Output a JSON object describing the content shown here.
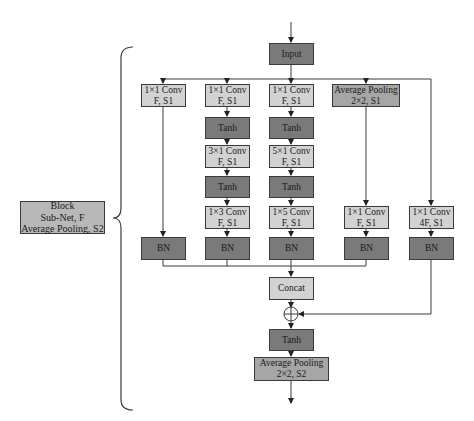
{
  "diagram": {
    "input": {
      "label": "Input"
    },
    "branches": [
      {
        "id": "branch-1",
        "nodes": [
          {
            "label1": "1×1 Conv",
            "label2": "F, S1"
          },
          {
            "label1": "BN"
          }
        ]
      },
      {
        "id": "branch-2",
        "nodes": [
          {
            "label1": "1×1 Conv",
            "label2": "F, S1"
          },
          {
            "label1": "Tanh"
          },
          {
            "label1": "3×1 Conv",
            "label2": "F, S1"
          },
          {
            "label1": "Tanh"
          },
          {
            "label1": "1×3 Conv",
            "label2": "F, S1"
          },
          {
            "label1": "BN"
          }
        ]
      },
      {
        "id": "branch-3",
        "nodes": [
          {
            "label1": "1×1 Conv",
            "label2": "F, S1"
          },
          {
            "label1": "Tanh"
          },
          {
            "label1": "5×1 Conv",
            "label2": "F, S1"
          },
          {
            "label1": "Tanh"
          },
          {
            "label1": "1×5 Conv",
            "label2": "F, S1"
          },
          {
            "label1": "BN"
          }
        ]
      },
      {
        "id": "branch-4",
        "nodes": [
          {
            "label1": "Average Pooling",
            "label2": "2×2, S1"
          },
          {
            "label1": "1×1 Conv",
            "label2": "F, S1"
          },
          {
            "label1": "BN"
          }
        ]
      },
      {
        "id": "branch-5-residual",
        "nodes": [
          {
            "label1": "1×1 Conv",
            "label2": "4F, S1"
          },
          {
            "label1": "BN"
          }
        ]
      }
    ],
    "concat": {
      "label": "Concat"
    },
    "add": {
      "symbol": "⊕"
    },
    "tanh_out": {
      "label": "Tanh"
    },
    "pool_out": {
      "label1": "Average Pooling",
      "label2": "2×2, S2"
    },
    "block_summary": {
      "line1": "Block",
      "line2": "Sub-Net, F",
      "line3": "Average Pooling, S2"
    },
    "colors": {
      "light": "#d2d2d2",
      "mid": "#a6a6a6",
      "dark": "#7a7a7a",
      "line": "#3a3a3a"
    }
  }
}
